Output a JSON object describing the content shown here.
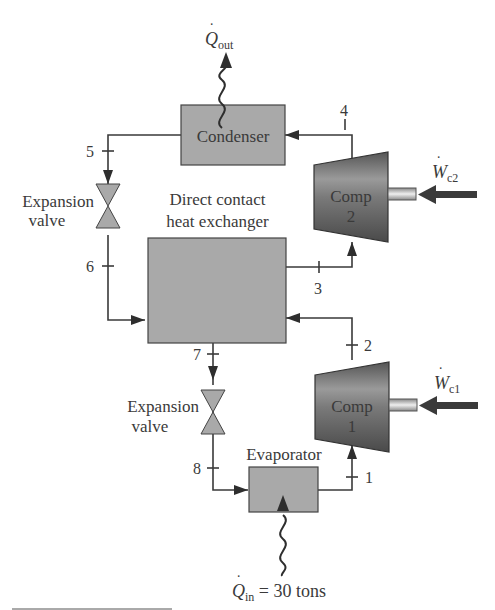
{
  "diagram": {
    "type": "two-stage vapor-compression refrigeration cycle",
    "components": {
      "condenser": {
        "label": "Condenser"
      },
      "heat_exchanger": {
        "label_line1": "Direct contact",
        "label_line2": "heat exchanger"
      },
      "evaporator": {
        "label": "Evaporator"
      },
      "compressor_2": {
        "label_line1": "Comp",
        "label_line2": "2"
      },
      "compressor_1": {
        "label_line1": "Comp",
        "label_line2": "1"
      },
      "expansion_valve_upper": {
        "label_line1": "Expansion",
        "label_line2": "valve"
      },
      "expansion_valve_lower": {
        "label_line1": "Expansion",
        "label_line2": "valve"
      }
    },
    "states": [
      "1",
      "2",
      "3",
      "4",
      "5",
      "6",
      "7",
      "8"
    ],
    "energy": {
      "q_out": {
        "symbol": "Q",
        "subscript": "out"
      },
      "q_in": {
        "symbol": "Q",
        "subscript": "in",
        "value": "= 30 tons"
      },
      "w_c2": {
        "symbol": "W",
        "subscript": "c2"
      },
      "w_c1": {
        "symbol": "W",
        "subscript": "c1"
      }
    },
    "colors": {
      "box_fill": "#a9a9a9",
      "compressor_fill": "#6e6e6e",
      "line": "#3a3a3a",
      "arrow": "#2e2e2e"
    }
  }
}
